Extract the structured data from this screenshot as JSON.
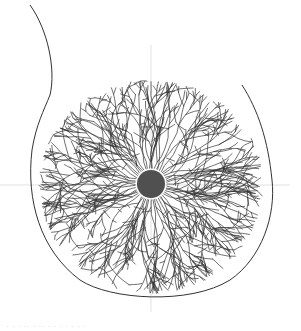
{
  "figure": {
    "type": "radial-venation-illustration",
    "center": {
      "x": 151,
      "y": 184
    },
    "hub_radius": 14,
    "hub_color": "#505050",
    "line_color": "#333333",
    "guide_color": "#d9d9d9",
    "outline": {
      "stem_path": "M30 5 C 48 30, 56 70, 50 95 C 44 110, 36 125, 32 150",
      "body_path": "M32 150 C 26 200, 40 250, 80 280 C 110 300, 190 305, 230 280 C 262 258, 276 215, 272 180 C 268 140, 258 110, 242 85"
    },
    "crosshair": {
      "horizontal": {
        "x1": 0,
        "x2": 290,
        "y": 185
      },
      "vertical": {
        "x": 151,
        "y1": 45,
        "y2": 312
      }
    },
    "radial_branches": {
      "count": 56,
      "inner_radius": 16,
      "seed": 7
    }
  },
  "caption": {
    "text": "· · · ·· · ·· · · · · ·  · ·"
  }
}
